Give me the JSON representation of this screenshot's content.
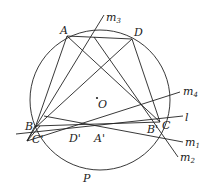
{
  "figure": {
    "points": {
      "A": "A",
      "D": "D",
      "B": "B",
      "C": "C",
      "B_prime": "B'",
      "C_prime": "C'",
      "D_prime": "D'",
      "A_prime": "A'",
      "O": "O",
      "P": "P"
    },
    "lines": {
      "m3": {
        "base": "m",
        "sub": "3"
      },
      "m4": {
        "base": "m",
        "sub": "4"
      },
      "l": "l",
      "m1": {
        "base": "m",
        "sub": "1"
      },
      "m2": {
        "base": "m",
        "sub": "2"
      }
    },
    "colors": {
      "stroke": "#222222",
      "background": "#ffffff"
    }
  }
}
